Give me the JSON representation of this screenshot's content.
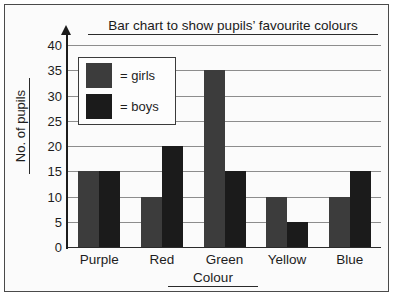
{
  "chart_data": {
    "type": "bar",
    "title": "Bar chart to show pupils’ favourite colours",
    "xlabel": "Colour",
    "ylabel": "No. of pupils",
    "categories": [
      "Purple",
      "Red",
      "Green",
      "Yellow",
      "Blue"
    ],
    "series": [
      {
        "name": "= girls",
        "key": "girls",
        "color": "#3c3c3c",
        "values": [
          15,
          10,
          35,
          10,
          10
        ]
      },
      {
        "name": "= boys",
        "key": "boys",
        "color": "#1b1b1b",
        "values": [
          15,
          20,
          15,
          5,
          15
        ]
      }
    ],
    "ylim": [
      0,
      40
    ],
    "ytick_step": 5,
    "yticks": [
      40,
      35,
      30,
      25,
      20,
      15,
      10,
      5,
      0
    ],
    "grid": true,
    "legend_position": "top-left",
    "legend_title": ""
  },
  "legend": {
    "items": [
      {
        "label": "= girls",
        "color": "#3c3c3c"
      },
      {
        "label": "= boys",
        "color": "#1b1b1b"
      }
    ]
  },
  "colors": {
    "girls": "#3c3c3c",
    "boys": "#1b1b1b",
    "axis": "#1c1c1c",
    "gridline": "#8d8d8d",
    "frame": "#4a4a4a",
    "page_background": "#fbfbfb"
  }
}
